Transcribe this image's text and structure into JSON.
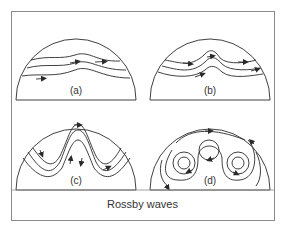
{
  "title": "Rossby waves",
  "panels": [
    {
      "label": "(a)",
      "description": "gentle wavy westerly flow"
    },
    {
      "label": "(b)",
      "description": "developing meander"
    },
    {
      "label": "(c)",
      "description": "large amplitude meanders"
    },
    {
      "label": "(d)",
      "description": "cut-off cyclonic and anticyclonic cells"
    }
  ],
  "colors": {
    "line": "#2a2a2a",
    "frame": "#8a8a8a",
    "background": "#ffffff"
  }
}
